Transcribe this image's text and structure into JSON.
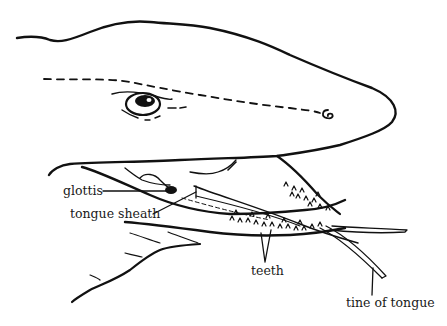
{
  "figure": {
    "labels": {
      "glottis": "glottis",
      "tongue_sheath": "tongue sheath",
      "teeth": "teeth",
      "tine_of_tongue": "tine of tongue"
    },
    "colors": {
      "ink": "#111111",
      "background": "#ffffff"
    }
  }
}
